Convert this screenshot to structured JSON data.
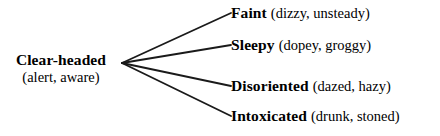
{
  "diagram": {
    "type": "semantic-fan-diagram",
    "background_color": "#ffffff",
    "line_color": "#1a1a1a",
    "text_color": "#000000",
    "root": {
      "headword": "Clear-headed",
      "gloss": "(alert, aware)"
    },
    "branches": [
      {
        "headword": "Faint",
        "gloss": "(dizzy, unsteady)"
      },
      {
        "headword": "Sleepy",
        "gloss": "(dopey, groggy)"
      },
      {
        "headword": "Disoriented",
        "gloss": "(dazed, hazy)"
      },
      {
        "headword": "Intoxicated",
        "gloss": "(drunk, stoned)"
      }
    ],
    "edges": {
      "origin": {
        "x": 122,
        "y": 63
      },
      "endpoints": [
        {
          "x": 231,
          "y": 13
        },
        {
          "x": 231,
          "y": 45
        },
        {
          "x": 231,
          "y": 86
        },
        {
          "x": 231,
          "y": 116
        }
      ],
      "stroke_width": 1.8
    }
  }
}
